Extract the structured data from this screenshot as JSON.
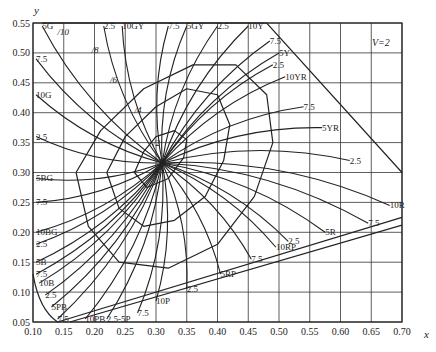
{
  "chart_data": {
    "type": "line",
    "annotation": "V=2",
    "xlabel": "x",
    "ylabel": "y",
    "xlim": [
      0.1,
      0.7
    ],
    "ylim": [
      0.05,
      0.55
    ],
    "grid": true,
    "x_ticks": [
      "0.10",
      "0.15",
      "0.20",
      "0.25",
      "0.30",
      "0.35",
      "0.40",
      "0.45",
      "0.50",
      "0.55",
      "0.60",
      "0.65",
      "0.70"
    ],
    "y_ticks": [
      "0.05",
      "0.10",
      "0.15",
      "0.20",
      "0.25",
      "0.30",
      "0.35",
      "0.40",
      "0.45",
      "0.50",
      "0.55"
    ],
    "white_point": {
      "x": 0.31,
      "y": 0.316
    },
    "chroma_labels": [
      "/2",
      "/4",
      "/6",
      "/8",
      "/10"
    ],
    "chroma_label_positions": [
      {
        "label": "/2",
        "x": 0.295,
        "y": 0.345
      },
      {
        "label": "/4",
        "x": 0.265,
        "y": 0.4
      },
      {
        "label": "/6",
        "x": 0.225,
        "y": 0.45
      },
      {
        "label": "/8",
        "x": 0.195,
        "y": 0.5
      },
      {
        "label": "/10",
        "x": 0.14,
        "y": 0.53
      }
    ],
    "hue_labels": [
      {
        "label": "5G",
        "x": 0.115,
        "y": 0.545
      },
      {
        "label": "7.5",
        "x": 0.105,
        "y": 0.49
      },
      {
        "label": "10G",
        "x": 0.105,
        "y": 0.43
      },
      {
        "label": "2.5",
        "x": 0.105,
        "y": 0.36
      },
      {
        "label": "5BG",
        "x": 0.105,
        "y": 0.29
      },
      {
        "label": "7.5",
        "x": 0.105,
        "y": 0.25
      },
      {
        "label": "10BG",
        "x": 0.105,
        "y": 0.2
      },
      {
        "label": "2.5",
        "x": 0.105,
        "y": 0.18
      },
      {
        "label": "5B",
        "x": 0.105,
        "y": 0.15
      },
      {
        "label": "7.5",
        "x": 0.105,
        "y": 0.13
      },
      {
        "label": "10B",
        "x": 0.11,
        "y": 0.115
      },
      {
        "label": "2.5",
        "x": 0.12,
        "y": 0.095
      },
      {
        "label": "5PB",
        "x": 0.13,
        "y": 0.075
      },
      {
        "label": "7.5",
        "x": 0.14,
        "y": 0.055
      },
      {
        "label": "10PB",
        "x": 0.185,
        "y": 0.055
      },
      {
        "label": "2.5-5P",
        "x": 0.22,
        "y": 0.055
      },
      {
        "label": "7.5",
        "x": 0.27,
        "y": 0.065
      },
      {
        "label": "10P",
        "x": 0.3,
        "y": 0.085
      },
      {
        "label": "2.5",
        "x": 0.35,
        "y": 0.105
      },
      {
        "label": "5RP",
        "x": 0.405,
        "y": 0.13
      },
      {
        "label": "7.5",
        "x": 0.455,
        "y": 0.155
      },
      {
        "label": "10RP",
        "x": 0.495,
        "y": 0.175
      },
      {
        "label": "2.5",
        "x": 0.515,
        "y": 0.185
      },
      {
        "label": "5R",
        "x": 0.575,
        "y": 0.2
      },
      {
        "label": "7.5",
        "x": 0.645,
        "y": 0.215
      },
      {
        "label": "10R",
        "x": 0.68,
        "y": 0.245
      },
      {
        "label": "2.5",
        "x": 0.615,
        "y": 0.32
      },
      {
        "label": "5YR",
        "x": 0.57,
        "y": 0.375
      },
      {
        "label": "7.5",
        "x": 0.54,
        "y": 0.41
      },
      {
        "label": "10YR",
        "x": 0.51,
        "y": 0.46
      },
      {
        "label": "2.5",
        "x": 0.49,
        "y": 0.48
      },
      {
        "label": "5Y",
        "x": 0.5,
        "y": 0.5
      },
      {
        "label": "7.5",
        "x": 0.485,
        "y": 0.52
      },
      {
        "label": "10Y",
        "x": 0.45,
        "y": 0.545
      },
      {
        "label": "2.5",
        "x": 0.4,
        "y": 0.545
      },
      {
        "label": "5GY",
        "x": 0.35,
        "y": 0.545
      },
      {
        "label": "7.5",
        "x": 0.32,
        "y": 0.545
      },
      {
        "label": "10GY",
        "x": 0.245,
        "y": 0.545
      },
      {
        "label": "2.5",
        "x": 0.215,
        "y": 0.545
      }
    ],
    "series": [
      {
        "name": "chroma /2 ellipse",
        "points": [
          [
            0.265,
            0.3
          ],
          [
            0.285,
            0.275
          ],
          [
            0.32,
            0.29
          ],
          [
            0.345,
            0.325
          ],
          [
            0.35,
            0.355
          ],
          [
            0.33,
            0.37
          ],
          [
            0.3,
            0.36
          ],
          [
            0.28,
            0.335
          ],
          [
            0.265,
            0.3
          ]
        ]
      },
      {
        "name": "chroma /4",
        "points": [
          [
            0.22,
            0.3
          ],
          [
            0.24,
            0.24
          ],
          [
            0.28,
            0.21
          ],
          [
            0.33,
            0.22
          ],
          [
            0.38,
            0.26
          ],
          [
            0.41,
            0.32
          ],
          [
            0.42,
            0.38
          ],
          [
            0.4,
            0.43
          ],
          [
            0.35,
            0.44
          ],
          [
            0.3,
            0.41
          ],
          [
            0.25,
            0.36
          ],
          [
            0.22,
            0.3
          ]
        ]
      },
      {
        "name": "chroma /6",
        "points": [
          [
            0.17,
            0.3
          ],
          [
            0.19,
            0.21
          ],
          [
            0.24,
            0.15
          ],
          [
            0.32,
            0.14
          ],
          [
            0.4,
            0.18
          ],
          [
            0.46,
            0.26
          ],
          [
            0.49,
            0.35
          ],
          [
            0.48,
            0.43
          ],
          [
            0.43,
            0.48
          ],
          [
            0.36,
            0.48
          ],
          [
            0.28,
            0.44
          ],
          [
            0.21,
            0.37
          ],
          [
            0.17,
            0.3
          ]
        ]
      }
    ]
  },
  "labels": {
    "y_axis": "y",
    "x_axis": "x",
    "value": "V=2"
  }
}
